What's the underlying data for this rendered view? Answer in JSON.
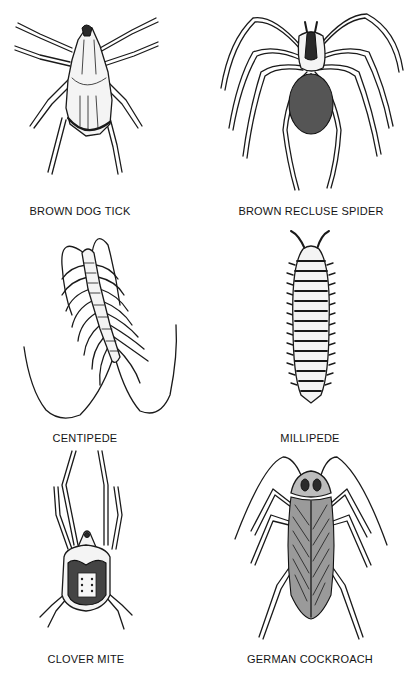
{
  "plate": {
    "background": "#ffffff",
    "ink_color": "#1a1a1a",
    "specimens": [
      {
        "id": "brown-dog-tick",
        "label": "BROWN DOG TICK",
        "column": "left",
        "row": 1
      },
      {
        "id": "brown-recluse-spider",
        "label": "BROWN RECLUSE SPIDER",
        "column": "right",
        "row": 1
      },
      {
        "id": "centipede",
        "label": "CENTIPEDE",
        "column": "left",
        "row": 2
      },
      {
        "id": "millipede",
        "label": "MILLIPEDE",
        "column": "right",
        "row": 2
      },
      {
        "id": "clover-mite",
        "label": "CLOVER MITE",
        "column": "left",
        "row": 3
      },
      {
        "id": "german-cockroach",
        "label": "GERMAN COCKROACH",
        "column": "right",
        "row": 3
      }
    ]
  }
}
